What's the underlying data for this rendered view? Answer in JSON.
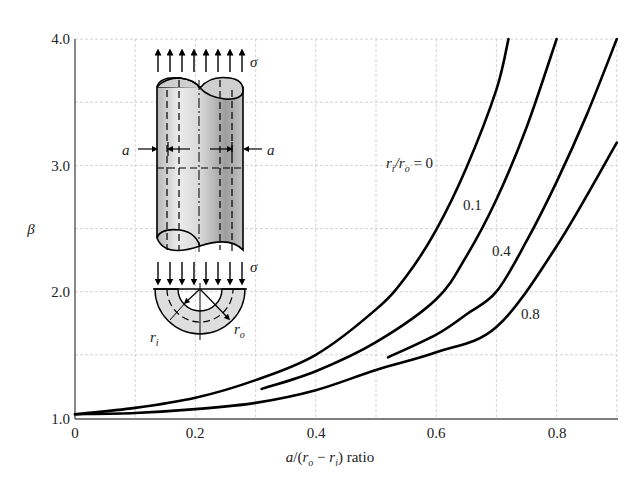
{
  "chart_data": {
    "type": "line",
    "title": "",
    "xlabel": "a/(r_o − r_i) ratio",
    "ylabel": "β",
    "xlim": [
      0,
      0.9
    ],
    "ylim": [
      1.0,
      4.0
    ],
    "x_ticks": [
      "0",
      "0.2",
      "0.4",
      "0.6",
      "0.8"
    ],
    "y_ticks": [
      "1.0",
      "2.0",
      "3.0",
      "4.0"
    ],
    "grid": true,
    "legend_title": "r_i/r_o",
    "series": [
      {
        "name": "r_i/r_o = 0",
        "label": "= 0",
        "x": [
          0,
          0.1,
          0.2,
          0.3,
          0.4,
          0.5,
          0.55,
          0.6,
          0.65,
          0.7,
          0.72
        ],
        "y": [
          1.03,
          1.08,
          1.16,
          1.3,
          1.5,
          1.86,
          2.12,
          2.49,
          2.98,
          3.6,
          4.0
        ]
      },
      {
        "name": "r_i/r_o = 0.1",
        "label": "0.1",
        "x": [
          0.31,
          0.4,
          0.5,
          0.6,
          0.65,
          0.7,
          0.75,
          0.8
        ],
        "y": [
          1.23,
          1.37,
          1.6,
          1.94,
          2.28,
          2.73,
          3.3,
          4.0
        ]
      },
      {
        "name": "r_i/r_o = 0.4",
        "label": "0.4",
        "x": [
          0.52,
          0.6,
          0.65,
          0.7,
          0.75,
          0.8,
          0.85,
          0.9
        ],
        "y": [
          1.48,
          1.66,
          1.82,
          2.0,
          2.4,
          2.87,
          3.4,
          4.0
        ]
      },
      {
        "name": "r_i/r_o = 0.8",
        "label": "0.8",
        "x": [
          0,
          0.1,
          0.2,
          0.3,
          0.4,
          0.5,
          0.6,
          0.7,
          0.8,
          0.9
        ],
        "y": [
          1.03,
          1.04,
          1.07,
          1.12,
          1.22,
          1.38,
          1.52,
          1.72,
          2.36,
          3.18
        ]
      }
    ]
  },
  "axes": {
    "x_ticks": [
      "0",
      "0.2",
      "0.4",
      "0.6",
      "0.8"
    ],
    "y_ticks": [
      "1.0",
      "2.0",
      "3.0",
      "4.0"
    ],
    "ylabel": "β",
    "xlabel_parts": {
      "a": "a",
      "slash": "/(",
      "ro": "r",
      "ro_sub": "o",
      "minus": " − ",
      "ri": "r",
      "ri_sub": "i",
      "close": ") ratio"
    }
  },
  "curve_labels": {
    "legend_r": "r",
    "legend_i": "i",
    "legend_slash": "/r",
    "legend_o": "o",
    "legend_eq": " = 0",
    "l1": "0.1",
    "l4": "0.4",
    "l8": "0.8"
  },
  "inset": {
    "sigma_top": "σ",
    "sigma_bottom": "σ",
    "a_left": "a",
    "a_right": "a",
    "r_inner": "r",
    "r_inner_sub": "i",
    "r_outer": "r",
    "r_outer_sub": "o"
  },
  "colors": {
    "curve": "#000000",
    "grid": "#c8c8c8",
    "cylinder_light": "#e6e6e6",
    "cylinder_dark": "#9a9a9a",
    "annulus": "#dcdcdc"
  }
}
